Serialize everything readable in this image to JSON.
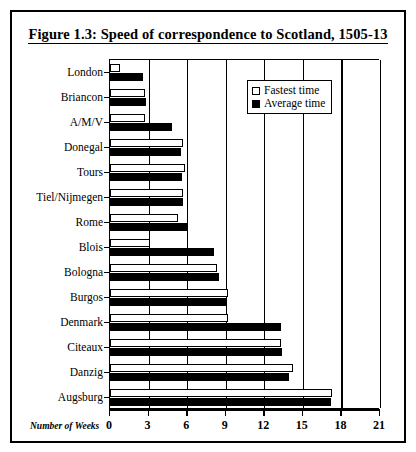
{
  "figure": {
    "title": "Figure 1.3: Speed of correspondence to Scotland, 1505-13"
  },
  "legend": {
    "items": [
      {
        "label": "Fastest time",
        "swatch": "white-square",
        "color": "#ffffff"
      },
      {
        "label": "Average time",
        "swatch": "black-square",
        "color": "#000000"
      }
    ]
  },
  "axis": {
    "x_title": "Number of Weeks",
    "x_ticks": [
      "0",
      "3",
      "6",
      "9",
      "12",
      "15",
      "18",
      "21"
    ]
  },
  "chart_data": {
    "type": "bar",
    "orientation": "horizontal",
    "title": "Figure 1.3: Speed of correspondence to Scotland, 1505-13",
    "xlabel": "Number of Weeks",
    "ylabel": "",
    "xlim": [
      0,
      21
    ],
    "xticks": [
      0,
      3,
      6,
      9,
      12,
      15,
      18,
      21
    ],
    "grid": true,
    "legend_position": "top-right",
    "categories": [
      "London",
      "Briancon",
      "A/M/V",
      "Donegal",
      "Tours",
      "Tiel/Nijmegen",
      "Rome",
      "Blois",
      "Bologna",
      "Burgos",
      "Denmark",
      "Citeaux",
      "Danzig",
      "Augsburg"
    ],
    "series": [
      {
        "name": "Fastest time",
        "color": "#ffffff",
        "values": [
          0.8,
          2.7,
          2.7,
          5.7,
          5.8,
          5.7,
          5.3,
          3.1,
          8.3,
          9.2,
          9.2,
          13.3,
          14.2,
          17.3
        ]
      },
      {
        "name": "Average time",
        "color": "#000000",
        "values": [
          2.6,
          2.8,
          4.8,
          5.5,
          5.6,
          5.7,
          6.0,
          8.1,
          8.5,
          9.1,
          13.3,
          13.4,
          13.9,
          17.2
        ]
      }
    ]
  }
}
